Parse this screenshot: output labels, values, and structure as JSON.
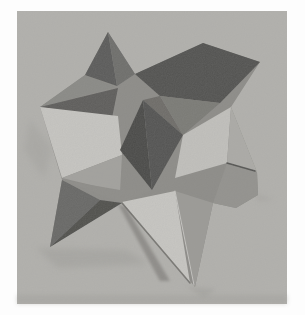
{
  "photo": {
    "subject": "grayscale photograph of a paper model of a small stellated dodecahedron standing on a plain surface",
    "canvas": {
      "width": 305,
      "height": 315,
      "page_background": "#fdfdfd"
    },
    "frame": {
      "x": 17,
      "y": 11,
      "width": 270,
      "height": 293,
      "background": "#b2b1ad"
    },
    "grain_opacity": 0.13,
    "palette": {
      "background_gray": "#b2b1ad",
      "darkest_facet": "#4d4d4b",
      "lightest_facet": "#c7c6c2",
      "border_white": "#fdfdfd"
    },
    "shadows": [
      {
        "name": "shadow-left-of-model",
        "points": "30,120 52,148 44,178 24,150",
        "fill": "#a5a4a0",
        "opacity": 0.55,
        "blur": 3
      },
      {
        "name": "shadow-under-lower-left-spike",
        "points": "36,248 126,250 148,264 58,268",
        "fill": "#a2a19d",
        "opacity": 0.6,
        "blur": 3
      },
      {
        "name": "shadow-streak-bottom",
        "points": "118,204 126,207 170,281 160,281",
        "fill": "#817f7b",
        "opacity": 0.7,
        "blur": 1.5
      },
      {
        "name": "shadow-under-bottom-tip",
        "points": "186,286 216,289 204,298",
        "fill": "#a3a29e",
        "opacity": 0.6,
        "blur": 2
      },
      {
        "name": "shadow-right-of-right-tip",
        "points": "255,192 274,200 257,202",
        "fill": "#a7a6a2",
        "opacity": 0.5,
        "blur": 2
      },
      {
        "name": "photo-bottom-edge-band",
        "points": "17,295 287,295 287,304 17,304",
        "fill": "#9f9e9a",
        "opacity": 0.4,
        "blur": 2
      }
    ],
    "facets": [
      {
        "name": "silhouette-base",
        "points": "40,107 85,75 108,32 135,74 203,43 260,62 231,107 257,172 258,195 236,208 213,203 195,287 122,202 50,247 62,180",
        "fill": "#8e8d89"
      },
      {
        "name": "left-spike-upper-face",
        "points": "40,107 85,75 115,87",
        "fill": "#8b8b87"
      },
      {
        "name": "left-valley-dark-face",
        "points": "40,107 118,88 112,118",
        "fill": "#605f5d"
      },
      {
        "name": "left-bright-face",
        "points": "40,107 118,116 122,155 62,178",
        "fill": "#c6c5c1"
      },
      {
        "name": "left-lower-medium-face",
        "points": "62,178 122,155 120,192",
        "fill": "#a3a29e"
      },
      {
        "name": "top-spike-left-face",
        "points": "108,32 85,75 117,86",
        "fill": "#5d5d5b"
      },
      {
        "name": "top-spike-right-face",
        "points": "108,32 117,86 135,74",
        "fill": "#6f6f6d"
      },
      {
        "name": "upper-right-spike-dark-face",
        "points": "135,74 203,43 260,62 220,103 160,96",
        "fill": "#545452"
      },
      {
        "name": "upper-right-gap-face",
        "points": "143,100 160,96 183,135",
        "fill": "#6f6e6a"
      },
      {
        "name": "upper-right-lower-face",
        "points": "160,96 220,103 183,135",
        "fill": "#7c7b77"
      },
      {
        "name": "right-bright-face",
        "points": "183,135 231,107 227,163 175,178",
        "fill": "#c1c0bc"
      },
      {
        "name": "right-spike-upper-face",
        "points": "231,107 257,172 227,163",
        "fill": "#acaba7"
      },
      {
        "name": "right-spike-lower-face",
        "points": "227,163 257,172 258,195 236,208 213,203",
        "fill": "#94938f"
      },
      {
        "name": "center-diamond-left-face",
        "points": "143,100 120,150 152,190",
        "fill": "#4d4d4b"
      },
      {
        "name": "center-diamond-right-face",
        "points": "143,100 183,135 152,190",
        "fill": "#575755"
      },
      {
        "name": "mid-lower-face",
        "points": "62,180 120,190 152,190 122,203",
        "fill": "#8f8e8a"
      },
      {
        "name": "bottom-bright-face",
        "points": "122,202 175,191 190,283",
        "fill": "#c7c6c2"
      },
      {
        "name": "bottom-cone-face",
        "points": "175,191 213,203 195,287",
        "fill": "#9c9b97"
      },
      {
        "name": "lower-left-spike-upper-face",
        "points": "50,247 62,180 100,200",
        "fill": "#6a6a68"
      },
      {
        "name": "lower-left-spike-lower-face",
        "points": "50,247 100,200 122,203",
        "fill": "#525250"
      }
    ],
    "creases": [
      {
        "name": "right-valley-dark-crease",
        "points": "227,163 255,171",
        "stroke": "#4b4b49",
        "width": 1.6
      },
      {
        "name": "bottom-spike-light-crease",
        "points": "175,191 194,285",
        "stroke": "#cfcecb",
        "width": 1
      },
      {
        "name": "bottom-edge-shadow-line",
        "points": "122,203 190,283",
        "stroke": "#6f6e6a",
        "width": 1.6
      }
    ]
  }
}
